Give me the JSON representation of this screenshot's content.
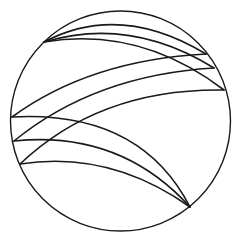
{
  "diagram": {
    "stroke_color": "#1a1a1a",
    "background": "#ffffff",
    "circle": {
      "cx": 120.5,
      "cy": 121,
      "r": 110,
      "stroke_width": 1.4
    },
    "points": {
      "A": [
        44,
        42
      ],
      "B": [
        190,
        207
      ],
      "R1": [
        206,
        54
      ],
      "R2": [
        214,
        68
      ],
      "R3": [
        224,
        90
      ],
      "L1": [
        12,
        117
      ],
      "L2": [
        14,
        141
      ],
      "L3": [
        20,
        164
      ]
    },
    "curves": [
      {
        "id": "A-R1",
        "d": "M44,42 Q120,2 206,54"
      },
      {
        "id": "A-R2",
        "d": "M44,42 Q130,16 214,68"
      },
      {
        "id": "A-R3",
        "d": "M44,42 Q140,26 224,90"
      },
      {
        "id": "L1-R1",
        "d": "M12,117 Q90,60 206,54"
      },
      {
        "id": "L2-R2",
        "d": "M14,141 Q95,75 214,68"
      },
      {
        "id": "L3-R3",
        "d": "M20,164 Q100,88 224,90"
      },
      {
        "id": "L1-B",
        "d": "M12,117 Q140,110 190,207"
      },
      {
        "id": "L2-B",
        "d": "M14,141 Q120,130 190,207"
      },
      {
        "id": "L3-B",
        "d": "M20,164 Q110,150 190,207"
      }
    ],
    "curve_stroke_width": 1.6
  }
}
